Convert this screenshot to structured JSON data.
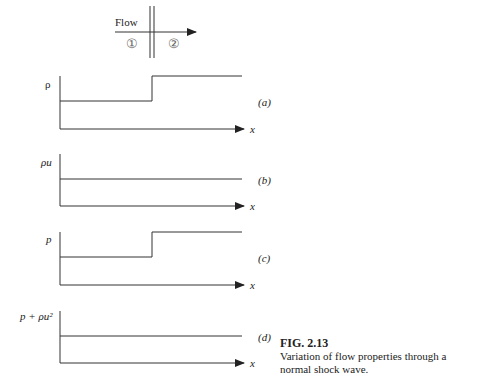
{
  "top": {
    "flow_label": "Flow",
    "region1": "①",
    "region2": "②"
  },
  "panels": [
    {
      "id": "a",
      "ylabel": "ρ",
      "tag": "(a)",
      "xlabel": "x",
      "shape": "step-up"
    },
    {
      "id": "b",
      "ylabel": "ρu",
      "tag": "(b)",
      "xlabel": "x",
      "shape": "constant"
    },
    {
      "id": "c",
      "ylabel": "p",
      "tag": "(c)",
      "xlabel": "x",
      "shape": "step-up"
    },
    {
      "id": "d",
      "ylabel": "p + ρu²",
      "tag": "(d)",
      "xlabel": "x",
      "shape": "constant"
    }
  ],
  "caption": {
    "title": "FIG. 2.13",
    "text": "Variation of flow properties through a normal shock wave."
  },
  "colors": {
    "line": "#333333",
    "background": "#ffffff"
  }
}
